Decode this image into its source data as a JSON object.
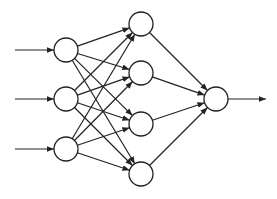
{
  "diagram": {
    "type": "feedforward-neural-network",
    "title": "",
    "colors": {
      "background": "#ffffff",
      "stroke": "#222222",
      "node_fill": "#ffffff"
    },
    "node_radius": 12,
    "layers": [
      {
        "name": "input",
        "nodes": [
          {
            "id": "i1",
            "x": 66,
            "y": 50
          },
          {
            "id": "i2",
            "x": 66,
            "y": 99
          },
          {
            "id": "i3",
            "x": 66,
            "y": 149
          }
        ]
      },
      {
        "name": "hidden",
        "nodes": [
          {
            "id": "h1",
            "x": 141,
            "y": 24
          },
          {
            "id": "h2",
            "x": 141,
            "y": 73
          },
          {
            "id": "h3",
            "x": 141,
            "y": 124
          },
          {
            "id": "h4",
            "x": 141,
            "y": 174
          }
        ]
      },
      {
        "name": "output",
        "nodes": [
          {
            "id": "o1",
            "x": 216,
            "y": 99
          }
        ]
      }
    ],
    "input_arrows": [
      {
        "from": [
          15,
          50
        ],
        "to": "i1"
      },
      {
        "from": [
          15,
          99
        ],
        "to": "i2"
      },
      {
        "from": [
          15,
          149
        ],
        "to": "i3"
      }
    ],
    "output_arrows": [
      {
        "from": "o1",
        "to": [
          266,
          99
        ]
      }
    ],
    "connections": "fully-connected",
    "labels": []
  }
}
